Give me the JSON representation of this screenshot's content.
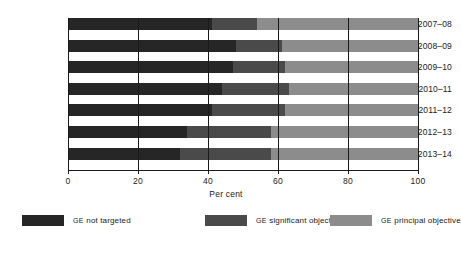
{
  "chart_data": {
    "type": "bar",
    "orientation": "horizontal",
    "stacked": true,
    "title": "",
    "xlabel": "Per cent",
    "ylabel": "",
    "xlim": [
      0,
      100
    ],
    "xticks": [
      0,
      20,
      40,
      60,
      80,
      100
    ],
    "xtick_labels": [
      "0",
      "20",
      "40",
      "60",
      "80",
      "100"
    ],
    "grid": true,
    "grid_axis": "x",
    "legend_position": "bottom",
    "categories": [
      "2007–08",
      "2008–09",
      "2009–10",
      "2010–11",
      "2011–12",
      "2012–13",
      "2013–14"
    ],
    "series": [
      {
        "name": "GE not targeted",
        "color": "#262626",
        "values": [
          41,
          48,
          47,
          44,
          41,
          34,
          32
        ]
      },
      {
        "name": "GE significant objective",
        "color": "#4a4a4a",
        "values": [
          13,
          13,
          15,
          19,
          21,
          24,
          26
        ]
      },
      {
        "name": "GE principal objective",
        "color": "#8c8c8c",
        "values": [
          46,
          39,
          38,
          37,
          38,
          42,
          42
        ]
      }
    ]
  },
  "axis": {
    "x_title": "Per cent",
    "tick_labels": [
      "0",
      "20",
      "40",
      "60",
      "80",
      "100"
    ],
    "category_labels": [
      "2007–08",
      "2008–09",
      "2009–10",
      "2010–11",
      "2011–12",
      "2012–13",
      "2013–14"
    ]
  },
  "legend": {
    "items": [
      {
        "prefix": "GE",
        "label": " not targeted",
        "color": "#262626"
      },
      {
        "prefix": "GE",
        "label": " significant objective",
        "color": "#4a4a4a"
      },
      {
        "prefix": "GE",
        "label": " principal objective",
        "color": "#8c8c8c"
      }
    ]
  },
  "colors": {
    "not_targeted": "#262626",
    "significant_objective": "#4a4a4a",
    "principal_objective": "#8c8c8c",
    "axis": "#1a1a1a",
    "background": "#ffffff"
  }
}
